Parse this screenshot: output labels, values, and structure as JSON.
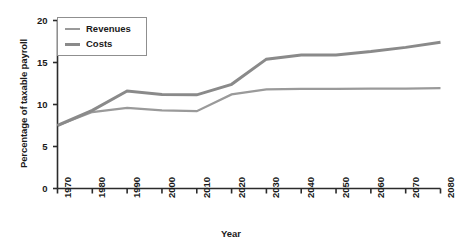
{
  "chart_data": {
    "type": "line",
    "title": "",
    "xlabel": "Year",
    "ylabel": "Percentage of taxable payroll",
    "xlim": [
      1970,
      2080
    ],
    "ylim": [
      0,
      20
    ],
    "yticks": [
      0,
      5,
      10,
      15,
      20
    ],
    "ytick_labels": [
      "0",
      "5",
      "10",
      "15",
      "20"
    ],
    "xticks": [
      1970,
      1980,
      1990,
      2000,
      2010,
      2020,
      2030,
      2040,
      2050,
      2060,
      2070,
      2080
    ],
    "xtick_labels": [
      "1970",
      "1980",
      "1990",
      "2000",
      "2010",
      "2020",
      "2030",
      "2040",
      "2050",
      "2060",
      "2070",
      "2080"
    ],
    "grid": false,
    "legend_position": "upper-left",
    "x": [
      1970,
      1980,
      1990,
      2000,
      2010,
      2020,
      2030,
      2040,
      2050,
      2060,
      2070,
      2080
    ],
    "series": [
      {
        "name": "Revenues",
        "color": "#9a9a9a",
        "width": 2.2,
        "values": [
          7.5,
          9.1,
          9.6,
          9.3,
          9.2,
          11.2,
          11.8,
          11.85,
          11.85,
          11.9,
          11.9,
          11.95
        ]
      },
      {
        "name": "Costs",
        "color": "#8a8a8a",
        "width": 3.0,
        "values": [
          7.5,
          9.3,
          11.6,
          11.2,
          11.15,
          12.4,
          15.4,
          15.9,
          15.9,
          16.3,
          16.8,
          17.4
        ]
      }
    ]
  },
  "legend": {
    "entries": [
      {
        "label": "Revenues"
      },
      {
        "label": "Costs"
      }
    ]
  },
  "axes": {
    "axis_color": "#2b2b2b",
    "tick_color": "#2b2b2b"
  }
}
